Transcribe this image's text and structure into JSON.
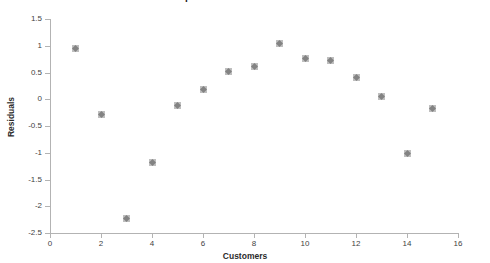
{
  "chart_data": {
    "type": "scatter",
    "title": "Scatterplot of Residuals vs Customers",
    "xlabel": "Customers",
    "ylabel": "Residuals",
    "xlim": [
      0,
      16
    ],
    "ylim": [
      -2.5,
      1.5
    ],
    "xticks": [
      "0",
      "2",
      "4",
      "6",
      "8",
      "10",
      "12",
      "14",
      "16"
    ],
    "yticks": [
      "1.5",
      "1",
      "0.5",
      "0",
      "-0.5",
      "-1",
      "-1.5",
      "-2",
      "-2.5"
    ],
    "grid": false,
    "legend": null,
    "marker": "diamond",
    "marker_color": "#7b7b7b",
    "x": [
      1,
      2,
      3,
      4,
      5,
      6,
      7,
      8,
      9,
      10,
      11,
      12,
      13,
      14,
      15
    ],
    "values": [
      0.94,
      -0.29,
      -2.23,
      -1.19,
      -0.12,
      0.18,
      0.52,
      0.62,
      1.04,
      0.77,
      0.73,
      0.4,
      0.05,
      -1.02,
      -0.18
    ],
    "points": [
      {
        "x": 1,
        "y": 0.94
      },
      {
        "x": 2,
        "y": -0.29
      },
      {
        "x": 3,
        "y": -2.23
      },
      {
        "x": 4,
        "y": -1.19
      },
      {
        "x": 5,
        "y": -0.12
      },
      {
        "x": 6,
        "y": 0.18
      },
      {
        "x": 7,
        "y": 0.52
      },
      {
        "x": 8,
        "y": 0.62
      },
      {
        "x": 9,
        "y": 1.04
      },
      {
        "x": 10,
        "y": 0.77
      },
      {
        "x": 11,
        "y": 0.73
      },
      {
        "x": 12,
        "y": 0.4
      },
      {
        "x": 13,
        "y": 0.05
      },
      {
        "x": 14,
        "y": -1.02
      },
      {
        "x": 15,
        "y": -0.18
      }
    ]
  }
}
